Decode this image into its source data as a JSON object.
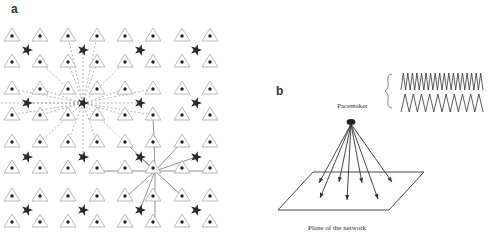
{
  "panels": {
    "a": {
      "label": "a",
      "grid": {
        "triangle_cols_x": [
          12,
          40,
          68,
          97,
          125,
          153,
          182,
          210
        ],
        "triangle_rows_y": [
          36,
          62,
          89,
          115,
          142,
          168,
          196,
          222
        ],
        "star_cols_x": [
          27,
          83,
          140,
          196
        ],
        "star_rows_y": [
          50,
          103,
          157,
          210
        ]
      },
      "dashed_hub": {
        "x": 83,
        "y": 103
      },
      "solid_hub": {
        "x": 155,
        "y": 171
      }
    },
    "b": {
      "label": "b",
      "pacemaker_label": "Pacemaker",
      "plane_label": "Plane of the network",
      "pacemaker": {
        "x": 351,
        "y": 122
      },
      "arrow_targets": [
        [
          319,
          183
        ],
        [
          320,
          198
        ],
        [
          339,
          182
        ],
        [
          347,
          200
        ],
        [
          362,
          183
        ],
        [
          378,
          199
        ],
        [
          392,
          182
        ]
      ],
      "plane": [
        [
          313,
          172
        ],
        [
          424,
          172
        ],
        [
          389,
          210
        ],
        [
          278,
          210
        ]
      ],
      "trace_top_peaks": 18,
      "trace_bottom_peaks": 10
    }
  },
  "colors": {
    "ink": "#333333",
    "dashed": "#9a9a9a",
    "triangle": "#aaaaaa"
  }
}
